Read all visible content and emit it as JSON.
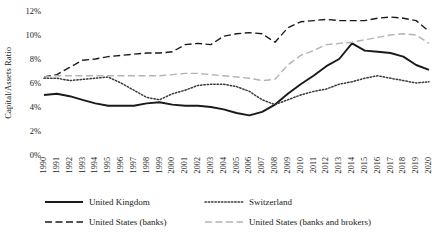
{
  "chart_data": {
    "type": "line",
    "title": "",
    "xlabel": "",
    "ylabel": "Capital/Assets Ratio",
    "ylim": [
      0,
      12
    ],
    "ytick_labels": [
      "0%",
      "2%",
      "4%",
      "6%",
      "8%",
      "10%",
      "12%"
    ],
    "ytick_values": [
      0,
      2,
      4,
      6,
      8,
      10,
      12
    ],
    "grid": false,
    "legend_position": "bottom",
    "x": [
      1990,
      1991,
      1992,
      1993,
      1994,
      1995,
      1996,
      1997,
      1998,
      1999,
      2000,
      2001,
      2002,
      2003,
      2004,
      2005,
      2006,
      2007,
      2008,
      2009,
      2010,
      2011,
      2012,
      2013,
      2014,
      2015,
      2016,
      2017,
      2018,
      2019,
      2020
    ],
    "xtick_labels": [
      "1990",
      "1991",
      "1992",
      "1993",
      "1994",
      "1995",
      "1996",
      "1997",
      "1998",
      "1999",
      "2000",
      "2001",
      "2002",
      "2003",
      "2004",
      "2005",
      "2006",
      "2007",
      "2008",
      "2009",
      "2010",
      "2011",
      "2012",
      "2013",
      "2014",
      "2015",
      "2016",
      "2017",
      "2018",
      "2019",
      "2020"
    ],
    "series": [
      {
        "name": "United Kingdom",
        "style": "solid",
        "color": "#1a1a1a",
        "values": [
          5.0,
          5.1,
          4.9,
          4.6,
          4.3,
          4.1,
          4.1,
          4.1,
          4.3,
          4.4,
          4.2,
          4.1,
          4.1,
          4.0,
          3.8,
          3.5,
          3.3,
          3.6,
          4.2,
          5.1,
          5.9,
          6.6,
          7.4,
          8.0,
          9.3,
          8.7,
          8.6,
          8.5,
          8.2,
          7.5,
          7.1
        ]
      },
      {
        "name": "Switzerland",
        "style": "dotted",
        "color": "#3a3a3a",
        "values": [
          6.4,
          6.4,
          6.2,
          6.3,
          6.4,
          6.5,
          6.0,
          5.4,
          4.8,
          4.6,
          5.1,
          5.4,
          5.8,
          5.9,
          5.9,
          5.7,
          5.3,
          4.6,
          4.2,
          4.6,
          5.0,
          5.3,
          5.5,
          5.9,
          6.1,
          6.4,
          6.6,
          6.4,
          6.2,
          6.0,
          6.1
        ]
      },
      {
        "name": "United States (banks)",
        "style": "dashed",
        "color": "#1a1a1a",
        "values": [
          6.5,
          6.7,
          7.3,
          7.9,
          8.0,
          8.2,
          8.3,
          8.4,
          8.5,
          8.5,
          8.6,
          9.2,
          9.3,
          9.2,
          9.9,
          10.1,
          10.2,
          10.1,
          9.4,
          10.6,
          11.1,
          11.2,
          11.3,
          11.2,
          11.2,
          11.2,
          11.4,
          11.5,
          11.4,
          11.2,
          10.3
        ]
      },
      {
        "name": "United States (banks and brokers)",
        "style": "dashed",
        "color": "#b3b3b3",
        "values": [
          6.5,
          6.6,
          6.6,
          6.6,
          6.6,
          6.6,
          6.6,
          6.6,
          6.6,
          6.6,
          6.7,
          6.8,
          6.8,
          6.7,
          6.6,
          6.5,
          6.4,
          6.2,
          6.3,
          7.5,
          8.3,
          8.7,
          9.2,
          9.3,
          9.4,
          9.6,
          9.8,
          10.0,
          10.1,
          10.0,
          9.3
        ]
      }
    ]
  },
  "legend": {
    "items": [
      {
        "label": "United Kingdom",
        "style": "solid",
        "color": "#1a1a1a"
      },
      {
        "label": "Switzerland",
        "style": "dotted",
        "color": "#3a3a3a"
      },
      {
        "label": "United States (banks)",
        "style": "dashed",
        "color": "#1a1a1a"
      },
      {
        "label": "United States (banks and brokers)",
        "style": "dashed",
        "color": "#b3b3b3"
      }
    ]
  }
}
